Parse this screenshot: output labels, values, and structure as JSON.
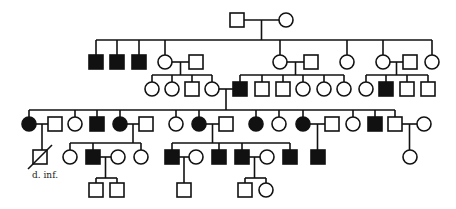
{
  "diagram": {
    "type": "pedigree",
    "symbol_size": 14,
    "colors": {
      "line": "#111111",
      "affected": "#111111",
      "unaffected": "#ffffff"
    },
    "labels": [
      {
        "id": "v1-label",
        "text": "d. inf.",
        "x": 32,
        "y": 178
      }
    ],
    "individuals": [
      {
        "id": "I-1",
        "sex": "male",
        "affected": false,
        "x": 237,
        "y": 20
      },
      {
        "id": "I-2",
        "sex": "female",
        "affected": false,
        "x": 286,
        "y": 20
      },
      {
        "id": "II-1",
        "sex": "male",
        "affected": true,
        "x": 96,
        "y": 62
      },
      {
        "id": "II-2",
        "sex": "male",
        "affected": true,
        "x": 117,
        "y": 62
      },
      {
        "id": "II-3",
        "sex": "male",
        "affected": true,
        "x": 139,
        "y": 62
      },
      {
        "id": "II-4",
        "sex": "female",
        "affected": false,
        "x": 165,
        "y": 62
      },
      {
        "id": "II-4s",
        "sex": "male",
        "affected": false,
        "x": 196,
        "y": 62
      },
      {
        "id": "II-5",
        "sex": "female",
        "affected": false,
        "x": 280,
        "y": 62
      },
      {
        "id": "II-5s",
        "sex": "male",
        "affected": false,
        "x": 311,
        "y": 62
      },
      {
        "id": "II-6",
        "sex": "female",
        "affected": false,
        "x": 347,
        "y": 62
      },
      {
        "id": "II-7",
        "sex": "female",
        "affected": false,
        "x": 383,
        "y": 62
      },
      {
        "id": "II-7s",
        "sex": "male",
        "affected": false,
        "x": 410,
        "y": 62
      },
      {
        "id": "II-8",
        "sex": "female",
        "affected": false,
        "x": 432,
        "y": 62
      },
      {
        "id": "III-1",
        "sex": "female",
        "affected": false,
        "x": 152,
        "y": 89
      },
      {
        "id": "III-2",
        "sex": "female",
        "affected": false,
        "x": 172,
        "y": 89
      },
      {
        "id": "III-3",
        "sex": "male",
        "affected": false,
        "x": 192,
        "y": 89
      },
      {
        "id": "III-4",
        "sex": "female",
        "affected": false,
        "x": 212,
        "y": 89
      },
      {
        "id": "III-5",
        "sex": "male",
        "affected": true,
        "x": 240,
        "y": 89
      },
      {
        "id": "III-6",
        "sex": "male",
        "affected": false,
        "x": 262,
        "y": 89
      },
      {
        "id": "III-7",
        "sex": "male",
        "affected": false,
        "x": 283,
        "y": 89
      },
      {
        "id": "III-8",
        "sex": "female",
        "affected": false,
        "x": 303,
        "y": 89
      },
      {
        "id": "III-9",
        "sex": "female",
        "affected": false,
        "x": 324,
        "y": 89
      },
      {
        "id": "III-10",
        "sex": "female",
        "affected": false,
        "x": 344,
        "y": 89
      },
      {
        "id": "III-11",
        "sex": "female",
        "affected": false,
        "x": 366,
        "y": 89
      },
      {
        "id": "III-12",
        "sex": "male",
        "affected": true,
        "x": 386,
        "y": 89
      },
      {
        "id": "III-13",
        "sex": "male",
        "affected": false,
        "x": 407,
        "y": 89
      },
      {
        "id": "III-14",
        "sex": "male",
        "affected": false,
        "x": 428,
        "y": 89
      },
      {
        "id": "IV-1",
        "sex": "female",
        "affected": true,
        "x": 29,
        "y": 124
      },
      {
        "id": "IV-1s",
        "sex": "male",
        "affected": false,
        "x": 55,
        "y": 124
      },
      {
        "id": "IV-2",
        "sex": "female",
        "affected": false,
        "x": 75,
        "y": 124
      },
      {
        "id": "IV-3",
        "sex": "male",
        "affected": true,
        "x": 97,
        "y": 124
      },
      {
        "id": "IV-4",
        "sex": "female",
        "affected": true,
        "x": 120,
        "y": 124
      },
      {
        "id": "IV-4s",
        "sex": "male",
        "affected": false,
        "x": 146,
        "y": 124
      },
      {
        "id": "IV-5",
        "sex": "female",
        "affected": false,
        "x": 176,
        "y": 124
      },
      {
        "id": "IV-6",
        "sex": "female",
        "affected": true,
        "x": 199,
        "y": 124
      },
      {
        "id": "IV-6s",
        "sex": "male",
        "affected": false,
        "x": 226,
        "y": 124
      },
      {
        "id": "IV-7",
        "sex": "female",
        "affected": true,
        "x": 256,
        "y": 124
      },
      {
        "id": "IV-8",
        "sex": "female",
        "affected": false,
        "x": 279,
        "y": 124
      },
      {
        "id": "IV-9",
        "sex": "female",
        "affected": true,
        "x": 303,
        "y": 124
      },
      {
        "id": "IV-9s",
        "sex": "male",
        "affected": false,
        "x": 332,
        "y": 124
      },
      {
        "id": "IV-10",
        "sex": "female",
        "affected": false,
        "x": 353,
        "y": 124
      },
      {
        "id": "IV-11",
        "sex": "male",
        "affected": true,
        "x": 375,
        "y": 124
      },
      {
        "id": "IV-12",
        "sex": "male",
        "affected": false,
        "x": 395,
        "y": 124
      },
      {
        "id": "IV-12s",
        "sex": "female",
        "affected": false,
        "x": 424,
        "y": 124
      },
      {
        "id": "V-1",
        "sex": "male",
        "affected": false,
        "deceased": true,
        "x": 40,
        "y": 157
      },
      {
        "id": "V-2",
        "sex": "female",
        "affected": false,
        "x": 70,
        "y": 157
      },
      {
        "id": "V-3",
        "sex": "male",
        "affected": true,
        "x": 93,
        "y": 157
      },
      {
        "id": "V-3s",
        "sex": "female",
        "affected": false,
        "x": 118,
        "y": 157
      },
      {
        "id": "V-4",
        "sex": "female",
        "affected": false,
        "x": 141,
        "y": 157
      },
      {
        "id": "V-5",
        "sex": "male",
        "affected": true,
        "x": 172,
        "y": 157
      },
      {
        "id": "V-5s",
        "sex": "female",
        "affected": false,
        "x": 196,
        "y": 157
      },
      {
        "id": "V-6",
        "sex": "male",
        "affected": true,
        "x": 219,
        "y": 157
      },
      {
        "id": "V-7",
        "sex": "male",
        "affected": true,
        "x": 242,
        "y": 157
      },
      {
        "id": "V-7s",
        "sex": "female",
        "affected": false,
        "x": 267,
        "y": 157
      },
      {
        "id": "V-8",
        "sex": "male",
        "affected": true,
        "x": 290,
        "y": 157
      },
      {
        "id": "V-9",
        "sex": "male",
        "affected": true,
        "x": 318,
        "y": 157
      },
      {
        "id": "V-10",
        "sex": "female",
        "affected": false,
        "x": 410,
        "y": 157
      },
      {
        "id": "VI-1",
        "sex": "male",
        "affected": false,
        "x": 96,
        "y": 190
      },
      {
        "id": "VI-2",
        "sex": "male",
        "affected": false,
        "x": 117,
        "y": 190
      },
      {
        "id": "VI-3",
        "sex": "male",
        "affected": false,
        "x": 184,
        "y": 190
      },
      {
        "id": "VI-4",
        "sex": "male",
        "affected": false,
        "x": 245,
        "y": 190
      },
      {
        "id": "VI-5",
        "sex": "female",
        "affected": false,
        "x": 266,
        "y": 190
      }
    ],
    "families": [
      {
        "parents": [
          "I-1",
          "I-2"
        ],
        "bar_y": 40,
        "children": [
          "II-1",
          "II-2",
          "II-3",
          "II-4",
          "II-5",
          "II-6",
          "II-7",
          "II-8"
        ]
      },
      {
        "parents": [
          "II-4",
          "II-4s"
        ],
        "bar_y": 75,
        "children": [
          "III-1",
          "III-2",
          "III-3",
          "III-4"
        ]
      },
      {
        "parents": [
          "II-5",
          "II-5s"
        ],
        "bar_y": 75,
        "children": [
          "III-5",
          "III-6",
          "III-7",
          "III-8",
          "III-9",
          "III-10"
        ]
      },
      {
        "parents": [
          "II-7",
          "II-7s"
        ],
        "bar_y": 75,
        "children": [
          "III-11",
          "III-12",
          "III-13",
          "III-14"
        ]
      },
      {
        "parents": [
          "III-4",
          "III-5"
        ],
        "bar_y": 110,
        "children": [
          "IV-1",
          "IV-2",
          "IV-3",
          "IV-4",
          "IV-5",
          "IV-6",
          "IV-7",
          "IV-8",
          "IV-9",
          "IV-10",
          "IV-11",
          "IV-12"
        ]
      },
      {
        "parents": [
          "IV-1",
          "IV-1s"
        ],
        "bar_y": null,
        "children": [
          "V-1"
        ]
      },
      {
        "parents": [
          "IV-4",
          "IV-4s"
        ],
        "bar_y": 143,
        "children": [
          "V-2",
          "V-3",
          "V-4"
        ]
      },
      {
        "parents": [
          "IV-6",
          "IV-6s"
        ],
        "bar_y": 143,
        "children": [
          "V-5",
          "V-6",
          "V-7",
          "V-8"
        ]
      },
      {
        "parents": [
          "IV-9",
          "IV-9s"
        ],
        "bar_y": null,
        "children": [
          "V-9"
        ]
      },
      {
        "parents": [
          "IV-12",
          "IV-12s"
        ],
        "bar_y": null,
        "children": [
          "V-10"
        ]
      },
      {
        "parents": [
          "V-3",
          "V-3s"
        ],
        "bar_y": 178,
        "children": [
          "VI-1",
          "VI-2"
        ]
      },
      {
        "parents": [
          "V-5",
          "V-5s"
        ],
        "bar_y": null,
        "children": [
          "VI-3"
        ]
      },
      {
        "parents": [
          "V-7",
          "V-7s"
        ],
        "bar_y": 178,
        "children": [
          "VI-4",
          "VI-5"
        ]
      }
    ]
  }
}
